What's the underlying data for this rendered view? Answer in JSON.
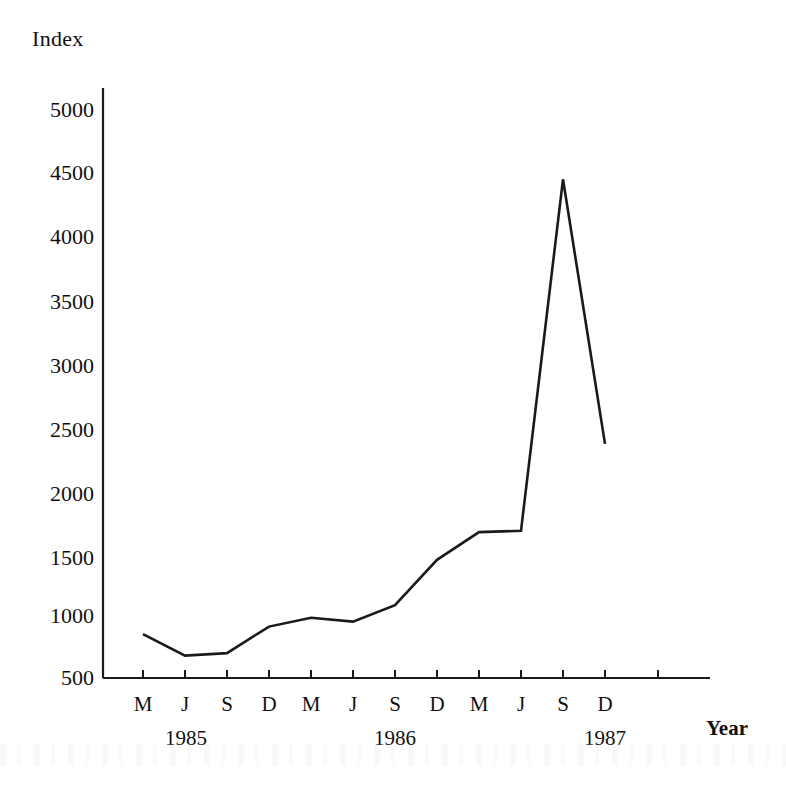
{
  "chart_data": {
    "type": "line",
    "title": "",
    "ylabel": "Index",
    "xlabel": "Year",
    "ylim": [
      500,
      5000
    ],
    "yticks": [
      500,
      1000,
      1500,
      2000,
      2500,
      3000,
      3500,
      4000,
      4500,
      5000
    ],
    "ytick_labels": [
      "500",
      "1000",
      "1500",
      "2000",
      "2500",
      "3000",
      "3500",
      "4000",
      "4500",
      "5000"
    ],
    "xtick_labels": [
      "M",
      "J",
      "S",
      "D",
      "M",
      "J",
      "S",
      "D",
      "M",
      "J",
      "S",
      "D"
    ],
    "x_group_labels": [
      "1985",
      "1986",
      "1987"
    ],
    "grid": false,
    "legend": null,
    "series": [
      {
        "name": "Index",
        "x": [
          "1985-M",
          "1985-J",
          "1985-S",
          "1985-D",
          "1986-M",
          "1986-J",
          "1986-S",
          "1986-D",
          "1987-M",
          "1987-J",
          "1987-S",
          "1987-D"
        ],
        "values": [
          840,
          670,
          690,
          900,
          970,
          940,
          1070,
          1430,
          1650,
          1660,
          4450,
          2350
        ]
      }
    ],
    "line_color": "#1a1a1a"
  },
  "axes": {
    "y_title": "Index",
    "x_title": "Year"
  }
}
